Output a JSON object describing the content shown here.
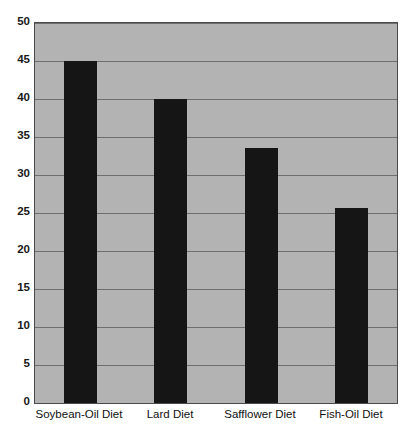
{
  "chart_data": {
    "type": "bar",
    "title": "",
    "subtitle": "",
    "xlabel": "",
    "ylabel": "",
    "categories": [
      "Soybean-Oil Diet",
      "Lard Diet",
      "Safflower Diet",
      "Fish-Oil Diet"
    ],
    "values": [
      45.0,
      40.0,
      33.5,
      25.7
    ],
    "ylim": [
      0,
      50
    ],
    "yticks": [
      0,
      5,
      10,
      15,
      20,
      25,
      30,
      35,
      40,
      45,
      50
    ],
    "ytick_labels": [
      "0",
      "5",
      "10",
      "15",
      "20",
      "25",
      "30",
      "35",
      "40",
      "45",
      "50"
    ],
    "grid": true,
    "grid_axis": "y",
    "legend": false,
    "legend_position": "none",
    "series": [
      {
        "name": "",
        "values": [
          45.0,
          40.0,
          33.5,
          25.7
        ]
      }
    ],
    "colors": {
      "bar": "#151515",
      "plot_background": "#b3b3b3",
      "gridline": "#6e6e6e",
      "frame": "#4a4a4a",
      "page_background": "#ffffff",
      "tick_text": "#1a1a1a",
      "category_text": "#111111"
    }
  }
}
